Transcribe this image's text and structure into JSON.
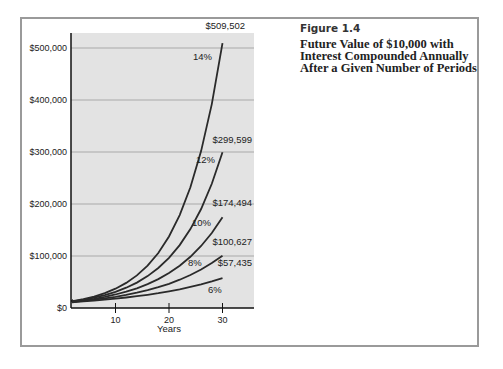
{
  "figure": {
    "label": "Figure 1.4",
    "title": "Future Value of $10,000 with Interest Compounded Annually After a Given Number of Periods"
  },
  "colors": {
    "plot_bg": "#e3e3e3",
    "grid": "#a9a9a9",
    "line": "#2a2a2a",
    "frame": "#9a9a9a"
  },
  "chart_data": {
    "type": "line",
    "title": "Future Value of $10,000 with Interest Compounded Annually After a Given Number of Periods",
    "xlabel": "Years",
    "ylabel": "",
    "xlim": [
      0,
      35
    ],
    "ylim": [
      0,
      520000
    ],
    "x_ticks": [
      10,
      20,
      30
    ],
    "y_ticks": [
      {
        "value": 0,
        "label": "$0"
      },
      {
        "value": 100000,
        "label": "$100,000"
      },
      {
        "value": 200000,
        "label": "$200,000"
      },
      {
        "value": 300000,
        "label": "$300,000"
      },
      {
        "value": 400000,
        "label": "$400,000"
      },
      {
        "value": 500000,
        "label": "$500,000"
      }
    ],
    "grid": true,
    "legend": "inline labels",
    "x": [
      2,
      4,
      6,
      8,
      10,
      12,
      14,
      16,
      18,
      20,
      22,
      24,
      26,
      28,
      30
    ],
    "series": [
      {
        "name": "6%",
        "end_label": "$57,435",
        "values": [
          11236,
          12625,
          14185,
          15938,
          17908,
          20122,
          22609,
          25404,
          28543,
          32071,
          36035,
          40489,
          45494,
          51117,
          57435
        ]
      },
      {
        "name": "8%",
        "end_label": "$100,627",
        "values": [
          11664,
          13605,
          15869,
          18509,
          21589,
          25182,
          29372,
          34259,
          39960,
          46610,
          54365,
          63412,
          73964,
          86271,
          100627
        ]
      },
      {
        "name": "10%",
        "end_label": "$174,494",
        "values": [
          12100,
          14641,
          17716,
          21436,
          25937,
          31384,
          37975,
          45950,
          55599,
          67275,
          81403,
          98497,
          119182,
          144210,
          174494
        ]
      },
      {
        "name": "12%",
        "end_label": "$299,599",
        "values": [
          12544,
          15735,
          19738,
          24760,
          31058,
          38960,
          48871,
          61304,
          76900,
          96463,
          121003,
          151786,
          190401,
          238839,
          299599
        ]
      },
      {
        "name": "14%",
        "end_label": "$509,502",
        "values": [
          12996,
          16890,
          21950,
          28526,
          37072,
          48179,
          62613,
          81372,
          105752,
          137435,
          178610,
          232122,
          301666,
          392045,
          509502
        ]
      }
    ]
  }
}
